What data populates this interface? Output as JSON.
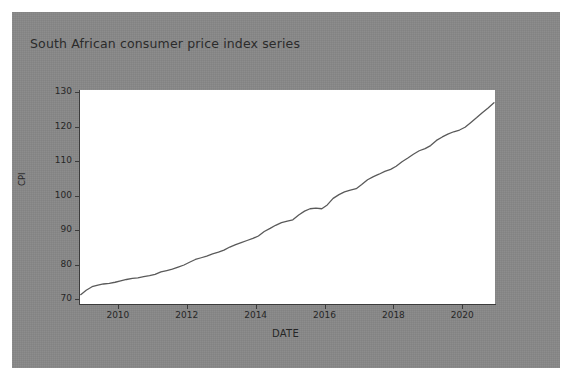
{
  "figure": {
    "background_color": "#878787",
    "plot_background_color": "#ffffff",
    "line_color": "#5a5a5a",
    "text_color": "#262626"
  },
  "chart_data": {
    "type": "line",
    "title": "South African consumer price index series",
    "xlabel": "DATE",
    "ylabel": "CPI",
    "grid": false,
    "legend": false,
    "xlim": [
      2008.9,
      2020.95
    ],
    "ylim": [
      68.6,
      130.6
    ],
    "xticks": [
      "2010",
      "2012",
      "2014",
      "2016",
      "2018",
      "2020"
    ],
    "xtick_values": [
      2010,
      2012,
      2014,
      2016,
      2018,
      2020
    ],
    "yticks": [
      "70",
      "80",
      "90",
      "100",
      "110",
      "120",
      "130"
    ],
    "ytick_values": [
      70,
      80,
      90,
      100,
      110,
      120,
      130
    ],
    "series": [
      {
        "name": "CPI",
        "x": [
          2008.92,
          2009.08,
          2009.25,
          2009.42,
          2009.58,
          2009.75,
          2009.92,
          2010.08,
          2010.25,
          2010.42,
          2010.58,
          2010.75,
          2010.92,
          2011.08,
          2011.25,
          2011.42,
          2011.58,
          2011.75,
          2011.92,
          2012.08,
          2012.25,
          2012.42,
          2012.58,
          2012.75,
          2012.92,
          2013.08,
          2013.25,
          2013.42,
          2013.58,
          2013.75,
          2013.92,
          2014.08,
          2014.25,
          2014.42,
          2014.58,
          2014.75,
          2014.92,
          2015.08,
          2015.25,
          2015.42,
          2015.58,
          2015.75,
          2015.92,
          2016.08,
          2016.25,
          2016.42,
          2016.58,
          2016.75,
          2016.92,
          2017.08,
          2017.25,
          2017.42,
          2017.58,
          2017.75,
          2017.92,
          2018.08,
          2018.25,
          2018.42,
          2018.58,
          2018.75,
          2018.92,
          2019.08,
          2019.25,
          2019.42,
          2019.58,
          2019.75,
          2019.92,
          2020.08,
          2020.25,
          2020.42,
          2020.58,
          2020.75,
          2020.92
        ],
        "y": [
          71.3,
          72.6,
          73.6,
          74.1,
          74.4,
          74.6,
          74.9,
          75.3,
          75.7,
          76.0,
          76.2,
          76.5,
          76.8,
          77.2,
          77.9,
          78.3,
          78.7,
          79.3,
          79.9,
          80.7,
          81.5,
          82.0,
          82.5,
          83.1,
          83.6,
          84.2,
          85.1,
          85.8,
          86.4,
          87.0,
          87.6,
          88.3,
          89.6,
          90.5,
          91.4,
          92.2,
          92.6,
          93.0,
          94.4,
          95.5,
          96.2,
          96.4,
          96.2,
          97.3,
          99.2,
          100.3,
          101.1,
          101.6,
          102.0,
          103.2,
          104.6,
          105.5,
          106.2,
          107.0,
          107.6,
          108.5,
          109.8,
          110.9,
          112.0,
          113.0,
          113.6,
          114.5,
          116.0,
          117.0,
          117.8,
          118.5,
          119.0,
          119.8,
          121.2,
          122.6,
          124.0,
          125.4,
          126.9
        ]
      }
    ]
  }
}
